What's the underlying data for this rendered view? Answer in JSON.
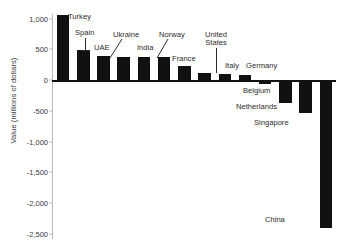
{
  "chart_data": {
    "type": "bar",
    "title": "",
    "xlabel": "",
    "ylabel": "Value (millions of dollars)",
    "ylim": [
      -2500,
      1000
    ],
    "grid": false,
    "legend": false,
    "ytick_labels": [
      "1,000",
      "500",
      "0",
      "-500",
      "-1,000",
      "-1,500",
      "-2,000",
      "-2,500"
    ],
    "yticks": [
      1000,
      500,
      0,
      -500,
      -1000,
      -1500,
      -2000,
      -2500
    ],
    "categories": [
      "Turkey",
      "Spain",
      "UAE",
      "Ukraine",
      "India",
      "Norway",
      "France",
      "United States",
      "Italy",
      "Germany",
      "Belgium",
      "Netherlands",
      "Singapore",
      "China"
    ],
    "values": [
      1060,
      480,
      390,
      380,
      375,
      370,
      230,
      120,
      100,
      85,
      -60,
      -380,
      -540,
      -2400
    ],
    "bar_color": "#111111"
  },
  "axis": {
    "y_title": "Value (millions of dollars)"
  },
  "labels": {
    "turkey": "Turkey",
    "spain": "Spain",
    "uae": "UAE",
    "ukraine": "Ukraine",
    "india": "India",
    "norway": "Norway",
    "france": "France",
    "united_states_line1": "United",
    "united_states_line2": "States",
    "italy": "Italy",
    "germany": "Germany",
    "belgium": "Belgium",
    "netherlands": "Netherlands",
    "singapore": "Singapore",
    "china": "China"
  },
  "ticks": {
    "t0": "1,000",
    "t1": "500",
    "t2": "0",
    "t3": "-500",
    "t4": "-1,000",
    "t5": "-1,500",
    "t6": "-2,000",
    "t7": "-2,500"
  }
}
